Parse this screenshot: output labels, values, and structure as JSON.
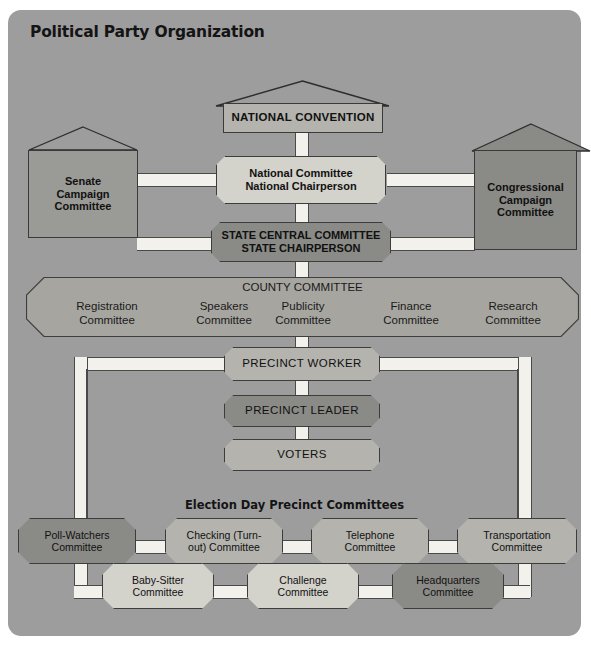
{
  "title": "Political Party Organization",
  "top": {
    "convention": "NATIONAL CONVENTION",
    "senate": "Senate\nCampaign\nCommittee",
    "senate_lines": [
      "Senate",
      "Campaign",
      "Committee"
    ],
    "congressional_lines": [
      "Congressional",
      "Campaign",
      "Committee"
    ],
    "national_committee_lines": [
      "National Committee",
      "National Chairperson"
    ],
    "state_committee_lines": [
      "STATE CENTRAL COMMITTEE",
      "STATE CHAIRPERSON"
    ]
  },
  "county": {
    "heading": "COUNTY COMMITTEE",
    "subcommittees": [
      {
        "l1": "Registration",
        "l2": "Committee"
      },
      {
        "l1": "Speakers",
        "l2": "Committee"
      },
      {
        "l1": "Publicity",
        "l2": "Committee"
      },
      {
        "l1": "Finance",
        "l2": "Committee"
      },
      {
        "l1": "Research",
        "l2": "Committee"
      }
    ]
  },
  "precinct": {
    "worker": "PRECINCT WORKER",
    "leader": "PRECINCT LEADER",
    "voters": "VOTERS"
  },
  "election_day": {
    "heading": "Election Day Precinct Committees",
    "row1": [
      {
        "l1": "Poll-Watchers",
        "l2": "Committee",
        "fill": "dark"
      },
      {
        "l1": "Checking (Turn-",
        "l2": "out) Committee",
        "fill": "light"
      },
      {
        "l1": "Telephone",
        "l2": "Committee",
        "fill": "light"
      },
      {
        "l1": "Transportation",
        "l2": "Committee",
        "fill": "light"
      }
    ],
    "row2": [
      {
        "l1": "Baby-Sitter",
        "l2": "Committee",
        "fill": "cream"
      },
      {
        "l1": "Challenge",
        "l2": "Committee",
        "fill": "cream"
      },
      {
        "l1": "Headquarters",
        "l2": "Committee",
        "fill": "dark"
      }
    ]
  },
  "colors": {
    "card_background": "#9d9d9d",
    "band": "#a6a5a0",
    "node_light": "#b4b3ad",
    "node_cream": "#d3d2cb",
    "node_dark": "#8a8a86",
    "connector": "#f2f1ec",
    "outline": "#3a3a3a"
  }
}
